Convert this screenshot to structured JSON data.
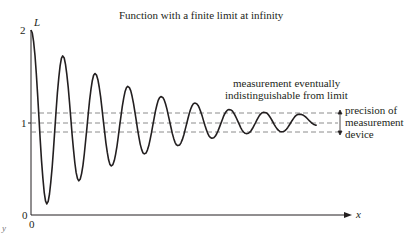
{
  "chart_data": {
    "type": "line",
    "title": "Function with a finite limit at infinity",
    "xlabel": "x",
    "ylabel": "L",
    "x_tick_labels": [
      "0"
    ],
    "y_tick_labels": [
      "0",
      "1",
      "2"
    ],
    "ylim": [
      0,
      2
    ],
    "limit_value": 1,
    "grid": false,
    "legend": null,
    "series": [
      {
        "name": "damped oscillation",
        "description": "f(x) = 1 + A·e^(-kx)·cos(ωx), starts at 2, oscillates around 1 with decaying amplitude",
        "peaks_y": [
          2.0,
          1.72,
          1.53,
          1.39,
          1.28,
          1.21,
          1.14,
          1.11
        ],
        "troughs_y": [
          0.12,
          0.37,
          0.53,
          0.66,
          0.75,
          0.83,
          0.88,
          0.9
        ]
      }
    ],
    "reference_lines": [
      {
        "y": 1.1,
        "style": "dashed",
        "label": "upper precision bound"
      },
      {
        "y": 1.0,
        "style": "dashed",
        "label": "limit L"
      },
      {
        "y": 0.9,
        "style": "dashed",
        "label": "lower precision bound"
      }
    ],
    "annotations": [
      "measurement eventually indistinguishable from limit",
      "precision of measurement device"
    ]
  },
  "labels": {
    "title": "Function with a finite limit at infinity",
    "y_axis_symbol": "L",
    "x_axis_symbol": "x",
    "y_tick_2": "2",
    "y_tick_1": "1",
    "y_tick_0": "0",
    "x_tick_0": "0",
    "corner_y": "y",
    "annotation_line1": "measurement eventually",
    "annotation_line2": "indistinguishable from limit",
    "precision_line1": "precision of",
    "precision_line2": "measurement",
    "precision_line3": "device"
  },
  "colors": {
    "curve": "#231f20",
    "axes": "#231f20",
    "dashed": "#808080"
  }
}
